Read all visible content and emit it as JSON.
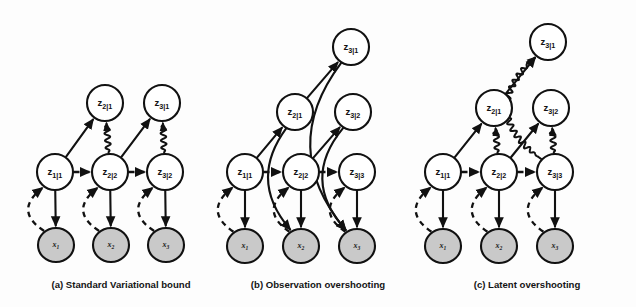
{
  "figure": {
    "background_color": "#fdfdfd",
    "ink_color": "#111111",
    "observed_node_fill": "#c9c9c9",
    "latent_node_fill": "#ffffff"
  },
  "legend_semantics": {
    "solid_arrow": "generative / transition edge",
    "dashed_arrow": "inference (posterior) edge",
    "wavy_arrow": "KL divergence regularizer"
  },
  "panels": [
    {
      "id": "a",
      "caption": "(a) Standard Variational bound",
      "caption_x": 121,
      "caption_y": 288,
      "nodes": [
        {
          "id": "a_z21",
          "label": "z",
          "sub": "2|1",
          "kind": "latent",
          "cx": 105,
          "cy": 103,
          "rx": 18,
          "ry": 18
        },
        {
          "id": "a_z31",
          "label": "z",
          "sub": "3|1",
          "kind": "latent",
          "cx": 162,
          "cy": 103,
          "rx": 18,
          "ry": 18
        },
        {
          "id": "a_z11",
          "label": "z",
          "sub": "1|1",
          "kind": "latent",
          "cx": 55,
          "cy": 172,
          "rx": 18,
          "ry": 18
        },
        {
          "id": "a_z22",
          "label": "z",
          "sub": "2|2",
          "kind": "latent",
          "cx": 110,
          "cy": 172,
          "rx": 18,
          "ry": 18
        },
        {
          "id": "a_z32",
          "label": "z",
          "sub": "3|2",
          "kind": "latent",
          "cx": 165,
          "cy": 172,
          "rx": 18,
          "ry": 18
        },
        {
          "id": "a_x1",
          "label": "x",
          "sub": "1",
          "kind": "observed",
          "cx": 56,
          "cy": 245,
          "rx": 18,
          "ry": 17
        },
        {
          "id": "a_x2",
          "label": "x",
          "sub": "2",
          "kind": "observed",
          "cx": 111,
          "cy": 245,
          "rx": 18,
          "ry": 17
        },
        {
          "id": "a_x3",
          "label": "x",
          "sub": "3",
          "kind": "observed",
          "cx": 166,
          "cy": 245,
          "rx": 18,
          "ry": 17
        }
      ],
      "edges": [
        {
          "type": "solid",
          "from": "a_z11",
          "to": "a_z21",
          "bow": 0
        },
        {
          "type": "solid",
          "from": "a_z22",
          "to": "a_z31",
          "bow": 0
        },
        {
          "type": "dashed",
          "from": "a_z11",
          "to": "a_z22",
          "bow": 0
        },
        {
          "type": "dashed",
          "from": "a_z22",
          "to": "a_z32",
          "bow": 0
        },
        {
          "type": "solid",
          "from": "a_z11",
          "to": "a_x1",
          "bow": 0
        },
        {
          "type": "solid",
          "from": "a_z22",
          "to": "a_x2",
          "bow": 0
        },
        {
          "type": "solid",
          "from": "a_z32",
          "to": "a_x3",
          "bow": 0
        },
        {
          "type": "dashed",
          "from": "a_x1",
          "to": "a_z11",
          "bow": -30
        },
        {
          "type": "dashed",
          "from": "a_x2",
          "to": "a_z22",
          "bow": -30
        },
        {
          "type": "dashed",
          "from": "a_x3",
          "to": "a_z32",
          "bow": -30
        },
        {
          "type": "wavy",
          "from": "a_z22",
          "to": "a_z21",
          "bow": 0
        },
        {
          "type": "wavy",
          "from": "a_z32",
          "to": "a_z31",
          "bow": 0
        }
      ]
    },
    {
      "id": "b",
      "caption": "(b) Observation overshooting",
      "caption_x": 318,
      "caption_y": 288,
      "nodes": [
        {
          "id": "b_z31",
          "label": "z",
          "sub": "3|1",
          "kind": "latent",
          "cx": 351,
          "cy": 47,
          "rx": 18,
          "ry": 18
        },
        {
          "id": "b_z21",
          "label": "z",
          "sub": "2|1",
          "kind": "latent",
          "cx": 295,
          "cy": 112,
          "rx": 18,
          "ry": 18
        },
        {
          "id": "b_z32",
          "label": "z",
          "sub": "3|2",
          "kind": "latent",
          "cx": 353,
          "cy": 112,
          "rx": 18,
          "ry": 18
        },
        {
          "id": "b_z11",
          "label": "z",
          "sub": "1|1",
          "kind": "latent",
          "cx": 245,
          "cy": 172,
          "rx": 18,
          "ry": 18
        },
        {
          "id": "b_z22",
          "label": "z",
          "sub": "2|2",
          "kind": "latent",
          "cx": 301,
          "cy": 172,
          "rx": 18,
          "ry": 18
        },
        {
          "id": "b_z33",
          "label": "z",
          "sub": "3|3",
          "kind": "latent",
          "cx": 357,
          "cy": 172,
          "rx": 18,
          "ry": 18
        },
        {
          "id": "b_x1",
          "label": "x",
          "sub": "1",
          "kind": "observed",
          "cx": 245,
          "cy": 246,
          "rx": 18,
          "ry": 17
        },
        {
          "id": "b_x2",
          "label": "x",
          "sub": "2",
          "kind": "observed",
          "cx": 301,
          "cy": 246,
          "rx": 18,
          "ry": 17
        },
        {
          "id": "b_x3",
          "label": "x",
          "sub": "3",
          "kind": "observed",
          "cx": 357,
          "cy": 246,
          "rx": 18,
          "ry": 17
        }
      ],
      "edges": [
        {
          "type": "solid",
          "from": "b_z11",
          "to": "b_z21",
          "bow": 0
        },
        {
          "type": "solid",
          "from": "b_z21",
          "to": "b_z31",
          "bow": 0
        },
        {
          "type": "solid",
          "from": "b_z22",
          "to": "b_z32",
          "bow": 0
        },
        {
          "type": "dashed",
          "from": "b_z11",
          "to": "b_z22",
          "bow": 0
        },
        {
          "type": "dashed",
          "from": "b_z22",
          "to": "b_z33",
          "bow": 0
        },
        {
          "type": "solid",
          "from": "b_z11",
          "to": "b_x1",
          "bow": 0
        },
        {
          "type": "solid",
          "from": "b_z22",
          "to": "b_x2",
          "bow": 0
        },
        {
          "type": "solid",
          "from": "b_z33",
          "to": "b_x3",
          "bow": 0
        },
        {
          "type": "dashed",
          "from": "b_x1",
          "to": "b_z11",
          "bow": -30
        },
        {
          "type": "dashed",
          "from": "b_x2",
          "to": "b_z22",
          "bow": -30
        },
        {
          "type": "dashed",
          "from": "b_x3",
          "to": "b_z33",
          "bow": -30
        },
        {
          "type": "solid",
          "from": "b_z21",
          "to": "b_x2",
          "bow": 40
        },
        {
          "type": "solid",
          "from": "b_z32",
          "to": "b_x3",
          "bow": 44
        },
        {
          "type": "solid",
          "from": "b_z31",
          "to": "b_x3",
          "bow": 66
        }
      ]
    },
    {
      "id": "c",
      "caption": "(c) Latent overshooting",
      "caption_x": 527,
      "caption_y": 288,
      "nodes": [
        {
          "id": "c_z31",
          "label": "z",
          "sub": "3|1",
          "kind": "latent",
          "cx": 548,
          "cy": 42,
          "rx": 18,
          "ry": 18
        },
        {
          "id": "c_z21",
          "label": "z",
          "sub": "2|1",
          "kind": "latent",
          "cx": 494,
          "cy": 108,
          "rx": 18,
          "ry": 18
        },
        {
          "id": "c_z32",
          "label": "z",
          "sub": "3|2",
          "kind": "latent",
          "cx": 551,
          "cy": 108,
          "rx": 18,
          "ry": 18
        },
        {
          "id": "c_z11",
          "label": "z",
          "sub": "1|1",
          "kind": "latent",
          "cx": 443,
          "cy": 172,
          "rx": 18,
          "ry": 18
        },
        {
          "id": "c_z22",
          "label": "z",
          "sub": "2|2",
          "kind": "latent",
          "cx": 499,
          "cy": 172,
          "rx": 18,
          "ry": 18
        },
        {
          "id": "c_z33",
          "label": "z",
          "sub": "3|3",
          "kind": "latent",
          "cx": 555,
          "cy": 172,
          "rx": 18,
          "ry": 18
        },
        {
          "id": "c_x1",
          "label": "x",
          "sub": "1",
          "kind": "observed",
          "cx": 443,
          "cy": 246,
          "rx": 18,
          "ry": 17
        },
        {
          "id": "c_x2",
          "label": "x",
          "sub": "2",
          "kind": "observed",
          "cx": 499,
          "cy": 246,
          "rx": 18,
          "ry": 17
        },
        {
          "id": "c_x3",
          "label": "x",
          "sub": "3",
          "kind": "observed",
          "cx": 555,
          "cy": 246,
          "rx": 18,
          "ry": 17
        }
      ],
      "edges": [
        {
          "type": "solid",
          "from": "c_z11",
          "to": "c_z21",
          "bow": 0
        },
        {
          "type": "solid",
          "from": "c_z21",
          "to": "c_z31",
          "bow": 0
        },
        {
          "type": "solid",
          "from": "c_z22",
          "to": "c_z32",
          "bow": 0
        },
        {
          "type": "dashed",
          "from": "c_z11",
          "to": "c_z22",
          "bow": 0
        },
        {
          "type": "dashed",
          "from": "c_z22",
          "to": "c_z33",
          "bow": 0
        },
        {
          "type": "solid",
          "from": "c_z11",
          "to": "c_x1",
          "bow": 0
        },
        {
          "type": "solid",
          "from": "c_z22",
          "to": "c_x2",
          "bow": 0
        },
        {
          "type": "solid",
          "from": "c_z33",
          "to": "c_x3",
          "bow": 0
        },
        {
          "type": "dashed",
          "from": "c_x1",
          "to": "c_z11",
          "bow": -30
        },
        {
          "type": "dashed",
          "from": "c_x2",
          "to": "c_z22",
          "bow": -30
        },
        {
          "type": "dashed",
          "from": "c_x3",
          "to": "c_z33",
          "bow": -30
        },
        {
          "type": "wavy",
          "from": "c_z22",
          "to": "c_z21",
          "bow": 0
        },
        {
          "type": "wavy",
          "from": "c_z33",
          "to": "c_z32",
          "bow": 0
        },
        {
          "type": "wavy",
          "from": "c_z33",
          "to": "c_z31",
          "bow": -62
        }
      ]
    }
  ]
}
